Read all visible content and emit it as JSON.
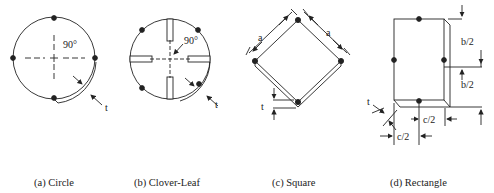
{
  "figure": {
    "panels": [
      {
        "id": "a",
        "caption": "(a) Circle",
        "angle_label": "90°",
        "thickness_label": "t"
      },
      {
        "id": "b",
        "caption": "(b) Clover-Leaf",
        "angle_label": "90°",
        "thickness_label": "t"
      },
      {
        "id": "c",
        "caption": "(c) Square",
        "side_label_left": "a",
        "side_label_right": "a",
        "thickness_label": "t"
      },
      {
        "id": "d",
        "caption": "(d) Rectangle",
        "half_height_top": "b/2",
        "half_height_bottom": "b/2",
        "half_width_top": "c/2",
        "half_width_bottom": "c/2",
        "thickness_label": "t"
      }
    ]
  },
  "colors": {
    "stroke": "#222222",
    "background": "#ffffff"
  }
}
